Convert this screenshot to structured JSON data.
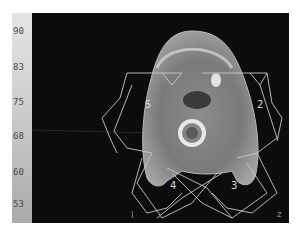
{
  "colorbar": {
    "ticks": [
      {
        "label": "90",
        "top": 26
      },
      {
        "label": "83",
        "top": 62
      },
      {
        "label": "75",
        "top": 97
      },
      {
        "label": "68",
        "top": 131
      },
      {
        "label": "60",
        "top": 167
      },
      {
        "label": "53",
        "top": 199
      }
    ]
  },
  "beams": [
    {
      "label": "5",
      "x": 116,
      "y": 92
    },
    {
      "label": "2",
      "x": 226,
      "y": 92
    },
    {
      "label": "4",
      "x": 139,
      "y": 173
    },
    {
      "label": "3",
      "x": 202,
      "y": 173
    }
  ],
  "corner_marks": {
    "bottom_left": "I",
    "bottom_right": "z"
  },
  "colors": {
    "background": "#0c0c0c",
    "beam_lines": "#c8c8c8",
    "colorbar_top": "#e4e4e4",
    "colorbar_bottom": "#a9a9a9"
  }
}
